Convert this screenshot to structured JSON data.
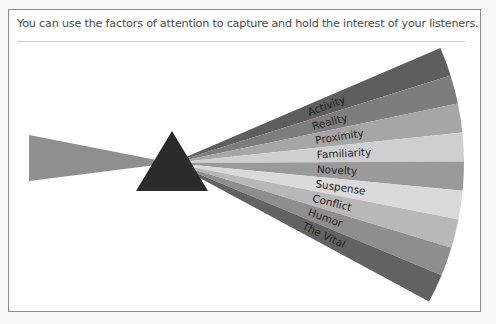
{
  "caption": "You can use the factors of attention to capture and hold the interest of your listeners.",
  "diagram": {
    "type": "prism-fan",
    "factors": [
      {
        "label": "Activity",
        "color": "#5e5e5e"
      },
      {
        "label": "Reality",
        "color": "#7d7d7d"
      },
      {
        "label": "Proximity",
        "color": "#a6a6a6"
      },
      {
        "label": "Familiarity",
        "color": "#cfcfcf"
      },
      {
        "label": "Novelty",
        "color": "#9a9a9a"
      },
      {
        "label": "Suspense",
        "color": "#dadada"
      },
      {
        "label": "Conflict",
        "color": "#b8b8b8"
      },
      {
        "label": "Humor",
        "color": "#8e8e8e"
      },
      {
        "label": "The Vital",
        "color": "#626262"
      }
    ],
    "beam_color": "#8f8f8f",
    "prism_color": "#2b2b2b"
  }
}
